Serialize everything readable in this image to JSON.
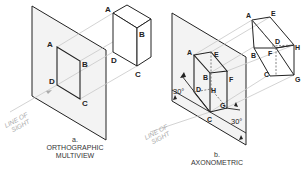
{
  "figure": {
    "panels": [
      {
        "id": "a",
        "letter": "a.",
        "caption_line1": "ORTHOGRAPHIC",
        "caption_line2": "MULTIVIEW",
        "line_of_sight_line1": "LINE OF",
        "line_of_sight_line2": "SIGHT",
        "projection_labels": [
          "A",
          "B",
          "C",
          "D"
        ],
        "object_labels": [
          "A",
          "B",
          "C",
          "D"
        ]
      },
      {
        "id": "b",
        "letter": "b.",
        "caption_line1": "AXONOMETRIC",
        "line_of_sight_line1": "LINE OF",
        "line_of_sight_line2": "SIGHT",
        "projection_labels": [
          "A",
          "B",
          "C",
          "D",
          "E",
          "F",
          "G",
          "H"
        ],
        "object_labels": [
          "A",
          "B",
          "C",
          "D",
          "E",
          "F",
          "G",
          "H"
        ],
        "angle_left": "30°",
        "angle_right": "30°"
      }
    ]
  },
  "colors": {
    "line": "#222222",
    "plane_fill": "#f2f2f2",
    "projector": "#c8c8c8",
    "hidden": "#666666"
  }
}
